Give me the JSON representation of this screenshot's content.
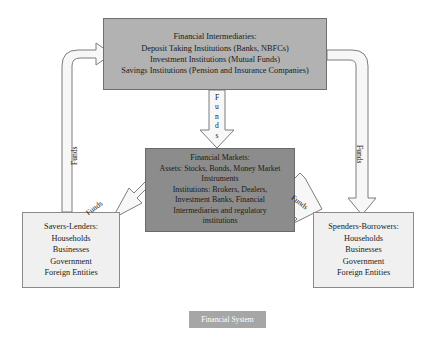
{
  "diagram": {
    "title": "Financial System",
    "caption_label": "Financial System",
    "colors": {
      "intermediaries_box": "#b2b2b2",
      "markets_box": "#8c8c8c",
      "party_box": "#f0f0f0",
      "caption_box": "#a6a6a6",
      "arrow_fill": "#f7f7f7",
      "arrow_stroke": "#7d7d7d",
      "text": "#1a1a1a",
      "background": "#ffffff"
    },
    "boxes": {
      "intermediaries": {
        "lines": [
          "Financial Intermediaries:",
          "Deposit Taking Institutions (Banks, NBFCs)",
          "Investment Institutions (Mutual Funds)",
          "Savings Institutions (Pension and Insurance Companies)"
        ]
      },
      "markets": {
        "lines": [
          "Financial Markets:",
          "Assets: Stocks, Bonds, Money Market",
          "Instruments",
          "Institutions: Brokers, Dealers,",
          "Investment Banks, Financial",
          "Intermediaries and regulatory",
          "institutions"
        ]
      },
      "savers": {
        "lines": [
          "Savers-Lenders:",
          "Households",
          "Businesses",
          "Government",
          "Foreign Entities"
        ]
      },
      "spenders": {
        "lines": [
          "Spenders-Borrowers:",
          "Households",
          "Businesses",
          "Government",
          "Foreign Entities"
        ]
      }
    },
    "arrows": {
      "left_vertical": {
        "label": "Funds",
        "from": "savers",
        "to": "intermediaries"
      },
      "right_vertical": {
        "label": "Funds",
        "from": "intermediaries",
        "to": "spenders"
      },
      "center_vertical": {
        "label": "Funds",
        "letters": [
          "F",
          "u",
          "n",
          "d",
          "s"
        ],
        "from": "intermediaries",
        "to": "markets"
      },
      "diagonal_left": {
        "label": "Funds",
        "from": "savers",
        "to": "markets"
      },
      "diagonal_right": {
        "label": "Funds",
        "from": "markets",
        "to": "spenders"
      }
    }
  }
}
